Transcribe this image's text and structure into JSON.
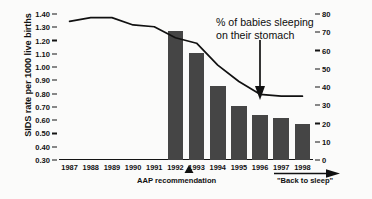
{
  "chart_data": {
    "type": "bar",
    "title": "",
    "categories": [
      "1987",
      "1988",
      "1989",
      "1990",
      "1991",
      "1992",
      "1993",
      "1994",
      "1995",
      "1996",
      "1997",
      "1998"
    ],
    "xlabel": "",
    "ylabel": "SIDS rate per 1000 live births",
    "ylabel_right": "",
    "ylim": [
      0.3,
      1.4
    ],
    "ylim_right": [
      0,
      80
    ],
    "yticks": [
      "1.40",
      "1.30",
      "1.20",
      "1.10",
      "1.00",
      "0.90",
      "0.80",
      "0.70",
      "0.60",
      "0.50",
      "0.40",
      "0.30"
    ],
    "ytick_values": [
      1.4,
      1.3,
      1.2,
      1.1,
      1.0,
      0.9,
      0.8,
      0.7,
      0.6,
      0.5,
      0.4,
      0.3
    ],
    "yticks_right": [
      "80",
      "70",
      "60",
      "50",
      "40",
      "30",
      "20",
      "10",
      "0"
    ],
    "ytick_values_right": [
      80,
      70,
      60,
      50,
      40,
      30,
      20,
      10,
      0
    ],
    "grid": false,
    "legend": "none",
    "series": [
      {
        "name": "SIDS rate per 1000 live births",
        "kind": "bar",
        "axis": "left",
        "color": "#454545",
        "x": [
          "1987",
          "1988",
          "1989",
          "1990",
          "1991",
          "1992",
          "1993",
          "1994",
          "1995",
          "1996",
          "1997",
          "1998"
        ],
        "values": [
          null,
          null,
          null,
          null,
          null,
          1.27,
          1.11,
          0.86,
          0.71,
          0.64,
          0.62,
          0.57
        ]
      },
      {
        "name": "% of babies sleeping on their stomach",
        "kind": "line",
        "axis": "right",
        "color": "#111111",
        "x": [
          "1987",
          "1988",
          "1989",
          "1990",
          "1991",
          "1992",
          "1993",
          "1994",
          "1995",
          "1996",
          "1997",
          "1998"
        ],
        "values": [
          76,
          78,
          78,
          74,
          73,
          67,
          64,
          52,
          43,
          36,
          35,
          35
        ]
      }
    ],
    "annotations": [
      {
        "name": "stomach-sleeping-annotation",
        "text_line1": "% of babies sleeping",
        "text_line2": "on their stomach",
        "arrow": "down",
        "points_to_year": "1996"
      },
      {
        "name": "aap-recommendation-annotation",
        "text": "AAP recommendation",
        "arrow": "up",
        "points_to_year": "1992"
      },
      {
        "name": "back-to-sleep-annotation",
        "text": "\"Back to sleep\"",
        "arrow": "right",
        "span_years": [
          "1996",
          "1998"
        ]
      }
    ]
  }
}
